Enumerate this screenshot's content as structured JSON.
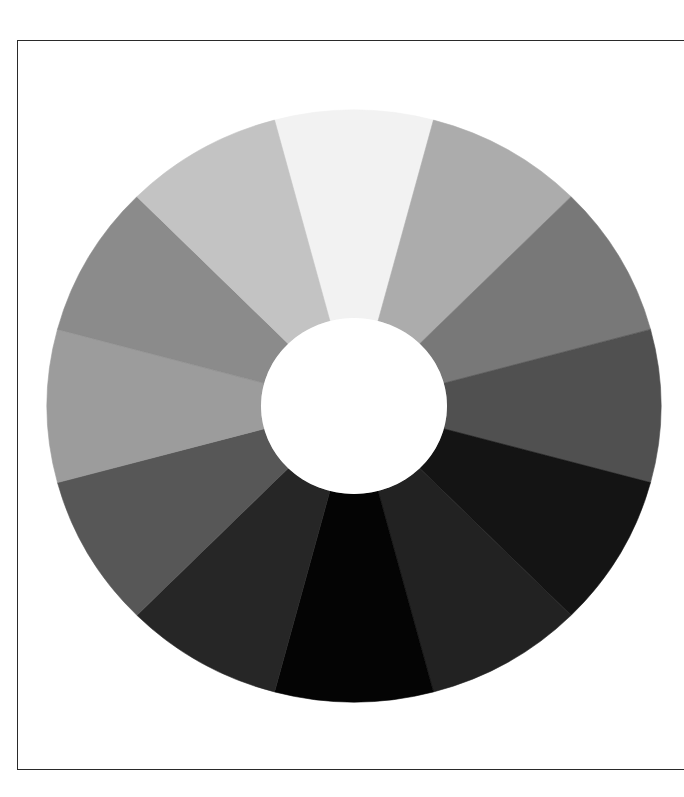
{
  "figure": {
    "type": "grayscale-value-wheel",
    "segment_count": 12,
    "center": {
      "x": 354,
      "y": 406
    },
    "outer_radius": {
      "rx": 307,
      "ry": 296
    },
    "inner_radius": {
      "rx": 93,
      "ry": 88
    },
    "inner_fill": "#ffffff",
    "segments": [
      {
        "angle": 0,
        "color": "#f2f2f2"
      },
      {
        "angle": 30,
        "color": "#acacac"
      },
      {
        "angle": 60,
        "color": "#787878"
      },
      {
        "angle": 90,
        "color": "#505050"
      },
      {
        "angle": 120,
        "color": "#141414"
      },
      {
        "angle": 150,
        "color": "#222222"
      },
      {
        "angle": 180,
        "color": "#040404"
      },
      {
        "angle": 210,
        "color": "#262626"
      },
      {
        "angle": 240,
        "color": "#575757"
      },
      {
        "angle": 270,
        "color": "#9c9c9c"
      },
      {
        "angle": 300,
        "color": "#8b8b8b"
      },
      {
        "angle": 330,
        "color": "#c3c3c3"
      }
    ]
  },
  "frame": {
    "border_color": "#2a2a2a"
  }
}
